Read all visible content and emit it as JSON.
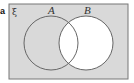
{
  "figure": {
    "part_label": "a",
    "universal_symbol": "ξ",
    "sets": [
      {
        "label": "A"
      },
      {
        "label": "B"
      }
    ],
    "shaded_region": "B'",
    "colors": {
      "shade": "#d9d9d9",
      "unshaded": "#ffffff",
      "outline": "#666666"
    }
  }
}
